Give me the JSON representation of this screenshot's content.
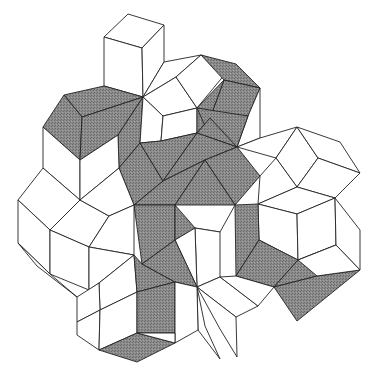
{
  "figure": {
    "width": 374,
    "height": 383,
    "colors": {
      "background": "#ffffff",
      "stroke": "#222222",
      "shaded_fill": "#8c8c8c",
      "shaded_dot": "#6a6a6a",
      "unshaded_fill": "#ffffff"
    },
    "tiles": [
      {
        "shade": "white",
        "points": "128,14 164,25 142,48 104,37"
      },
      {
        "shade": "white",
        "points": "104,37 142,48 143,97 104,86"
      },
      {
        "shade": "white",
        "points": "142,48 164,25 164,62 143,97"
      },
      {
        "shade": "gray",
        "points": "64,95 104,86 143,97 82,117"
      },
      {
        "shade": "gray",
        "points": "43,127 64,95 82,117 80,160"
      },
      {
        "shade": "gray",
        "points": "82,117 143,97 118,135 80,160"
      },
      {
        "shade": "gray",
        "points": "118,135 143,97 140,143 119,168"
      },
      {
        "shade": "gray",
        "points": "119,168 140,143 163,181 134,205"
      },
      {
        "shade": "white",
        "points": "43,127 80,160 80,200 43,168"
      },
      {
        "shade": "white",
        "points": "80,160 118,135 119,168 80,200"
      },
      {
        "shade": "white",
        "points": "143,97 164,62 201,55 176,77"
      },
      {
        "shade": "white",
        "points": "143,97 176,77 197,108 163,116"
      },
      {
        "shade": "white",
        "points": "176,77 201,55 230,68 197,108"
      },
      {
        "shade": "white",
        "points": "143,97 163,116 161,141 140,143"
      },
      {
        "shade": "white",
        "points": "163,116 197,108 197,133 161,141"
      },
      {
        "shade": "gray",
        "points": "201,55 236,64 260,88 224,80"
      },
      {
        "shade": "gray",
        "points": "224,80 260,88 248,116 210,118"
      },
      {
        "shade": "gray",
        "points": "197,108 224,80 210,118 197,133"
      },
      {
        "shade": "white",
        "points": "260,88 260,138 237,147 248,116"
      },
      {
        "shade": "gray",
        "points": "197,108 248,116 237,147 210,137"
      },
      {
        "shade": "gray",
        "points": "197,133 210,118 237,147 197,133"
      },
      {
        "shade": "gray",
        "points": "140,143 161,141 197,133 163,181"
      },
      {
        "shade": "gray",
        "points": "163,181 197,133 237,147 205,160"
      },
      {
        "shade": "gray",
        "points": "205,160 237,147 260,176 235,205"
      },
      {
        "shade": "gray",
        "points": "163,181 205,160 175,205 134,205"
      },
      {
        "shade": "gray",
        "points": "134,205 175,205 175,240 142,264"
      },
      {
        "shade": "gray",
        "points": "175,205 205,160 235,205 175,240"
      },
      {
        "shade": "white",
        "points": "237,147 260,138 297,127 276,158"
      },
      {
        "shade": "white",
        "points": "276,158 297,127 318,158 297,187"
      },
      {
        "shade": "white",
        "points": "297,127 340,142 360,173 318,158"
      },
      {
        "shade": "white",
        "points": "260,176 276,158 297,187 258,204"
      },
      {
        "shade": "white",
        "points": "297,187 318,158 360,173 335,198"
      },
      {
        "shade": "white",
        "points": "258,204 297,187 335,198 297,214"
      },
      {
        "shade": "white",
        "points": "258,204 297,214 298,260 259,240"
      },
      {
        "shade": "white",
        "points": "297,214 335,198 336,245 298,260"
      },
      {
        "shade": "white",
        "points": "335,198 360,230 360,270 336,245"
      },
      {
        "shade": "gray",
        "points": "235,205 258,204 259,240 236,276"
      },
      {
        "shade": "gray",
        "points": "236,276 259,240 298,260 274,287"
      },
      {
        "shade": "gray",
        "points": "274,287 298,260 336,245 317,276"
      },
      {
        "shade": "gray",
        "points": "274,287 317,276 360,270 297,321"
      },
      {
        "shade": "white",
        "points": "298,260 336,245 360,270 317,276"
      },
      {
        "shade": "white",
        "points": "175,205 235,205 220,232 195,228"
      },
      {
        "shade": "white",
        "points": "195,228 220,232 220,277 197,287"
      },
      {
        "shade": "white",
        "points": "175,240 195,228 197,287 175,240"
      },
      {
        "shade": "white",
        "points": "197,287 220,277 258,306 236,317"
      },
      {
        "shade": "white",
        "points": "220,277 236,276 274,287 258,306"
      },
      {
        "shade": "white",
        "points": "197,287 236,317 237,357 220,329"
      },
      {
        "shade": "white",
        "points": "197,287 205,326 220,359 198,330"
      },
      {
        "shade": "white",
        "points": "18,200 43,168 80,200 50,230"
      },
      {
        "shade": "white",
        "points": "18,200 50,230 50,274 18,243"
      },
      {
        "shade": "white",
        "points": "50,230 80,200 109,216 89,247"
      },
      {
        "shade": "white",
        "points": "50,230 89,247 89,290 50,274"
      },
      {
        "shade": "white",
        "points": "80,200 119,168 134,205 109,216"
      },
      {
        "shade": "white",
        "points": "109,216 134,205 134,255 89,247"
      },
      {
        "shade": "white",
        "points": "89,247 134,255 99,283 89,290"
      },
      {
        "shade": "white",
        "points": "18,243 50,274 77,297 37,266"
      },
      {
        "shade": "white",
        "points": "99,283 134,255 137,292 100,310"
      },
      {
        "shade": "white",
        "points": "77,297 99,283 100,310 77,322"
      },
      {
        "shade": "white",
        "points": "77,322 100,310 99,350 77,335"
      },
      {
        "shade": "white",
        "points": "100,310 137,292 137,333 99,350"
      },
      {
        "shade": "gray",
        "points": "134,255 142,264 175,282 137,292"
      },
      {
        "shade": "gray",
        "points": "137,292 175,282 175,333 137,333"
      },
      {
        "shade": "gray",
        "points": "142,264 175,240 197,287 175,282"
      },
      {
        "shade": "gray",
        "points": "99,350 137,333 175,343 137,362"
      },
      {
        "shade": "white",
        "points": "175,282 197,287 198,330 175,343"
      },
      {
        "shade": "white",
        "points": "137,333 175,333 175,343 137,333"
      }
    ]
  }
}
